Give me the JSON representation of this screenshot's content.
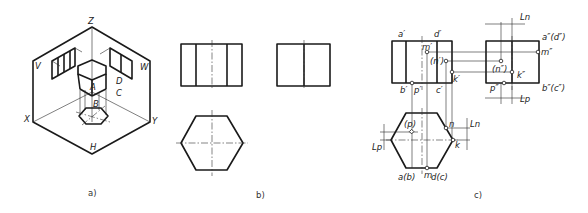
{
  "figure_a": {
    "caption": "a)",
    "axis_labels": {
      "z": "Z",
      "x": "X",
      "y": "Y"
    },
    "plane_labels": {
      "v": "V",
      "w": "W",
      "h": "H"
    },
    "face_labels": {
      "a": "A",
      "b": "B",
      "c": "C",
      "d": "D"
    }
  },
  "figure_b": {
    "caption": "b)"
  },
  "figure_c": {
    "caption": "c)",
    "front_view_labels": {
      "a": "a′",
      "d": "d′",
      "m": "m′",
      "n": "(n′)",
      "k": "k′",
      "b": "b′",
      "p": "p′",
      "c": "c′"
    },
    "side_view_labels": {
      "ad": "a″(d″)",
      "m": "m″",
      "n": "(n″)",
      "k": "k″",
      "p": "p″",
      "bc": "b″(c″)"
    },
    "top_view_labels": {
      "p": "(p)",
      "n": "n",
      "k": "k",
      "ab": "a(b)",
      "m": "m",
      "dc": "d(c)"
    },
    "dimension_labels": {
      "ln_side": "Ln",
      "lp_side": "Lp",
      "ln_top": "Ln",
      "lp_top": "Lp"
    }
  }
}
